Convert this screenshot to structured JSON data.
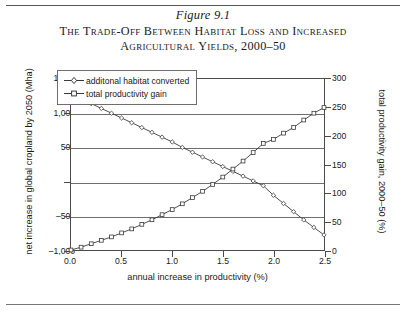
{
  "figure": {
    "number": "Figure 9.1",
    "title_line1": "The Trade-Off Between Habitat Loss and Increased",
    "title_line2": "Agricultural Yields, 2000–50"
  },
  "chart_data": {
    "type": "line",
    "title": "The Trade-Off Between Habitat Loss and Increased Agricultural Yields, 2000–50",
    "xlabel": "annual increase in productivity (%)",
    "ylabel": "net increase in global cropland by 2050 (Mha)",
    "ylabel_right": "total productivity gain, 2000–50 (%)",
    "xlim": [
      0.0,
      2.5
    ],
    "ylim": [
      -1000,
      1500
    ],
    "ylim_right": [
      0,
      300
    ],
    "xticks": [
      "0.0",
      "0.5",
      "1.0",
      "1.5",
      "2.0",
      "2.5"
    ],
    "xtick_values": [
      0.0,
      0.5,
      1.0,
      1.5,
      2.0,
      2.5
    ],
    "yticks": [
      "1,500",
      "1,000",
      "500",
      "0",
      "–500",
      "–1,000"
    ],
    "ytick_values": [
      1500,
      1000,
      500,
      0,
      -500,
      -1000
    ],
    "yticks_right": [
      "300",
      "250",
      "200",
      "150",
      "100",
      "50",
      "0"
    ],
    "ytick_values_right": [
      300,
      250,
      200,
      150,
      100,
      50,
      0
    ],
    "grid": "horizontal",
    "legend_position": "top-left-inside",
    "x": [
      0.0,
      0.1,
      0.2,
      0.3,
      0.4,
      0.5,
      0.6,
      0.7,
      0.8,
      0.9,
      1.0,
      1.1,
      1.2,
      1.3,
      1.4,
      1.5,
      1.6,
      1.7,
      1.8,
      1.9,
      2.0,
      2.1,
      2.2,
      2.3,
      2.4,
      2.5
    ],
    "series": [
      {
        "name": "additonal habitat converted",
        "axis": "left",
        "marker": "diamond",
        "values": [
          1300,
          1220,
          1140,
          1070,
          1000,
          930,
          860,
          790,
          720,
          650,
          580,
          500,
          430,
          360,
          290,
          220,
          150,
          80,
          10,
          -60,
          -200,
          -320,
          -440,
          -560,
          -670,
          -780
        ]
      },
      {
        "name": "total productivity gain",
        "axis": "right",
        "marker": "square",
        "values": [
          0,
          5,
          11,
          17,
          23,
          30,
          37,
          45,
          53,
          62,
          71,
          81,
          92,
          103,
          115,
          128,
          142,
          156,
          171,
          187,
          194,
          205,
          215,
          228,
          240,
          250
        ]
      }
    ]
  },
  "legend": {
    "items": [
      {
        "label": "additonal habitat converted",
        "marker": "diamond"
      },
      {
        "label": "total productivity gain",
        "marker": "square"
      }
    ]
  },
  "colors": {
    "line": "#3a3a3a",
    "grid": "#6e6e6e",
    "frame": "#4a4a4a",
    "text": "#1a1a1a"
  }
}
